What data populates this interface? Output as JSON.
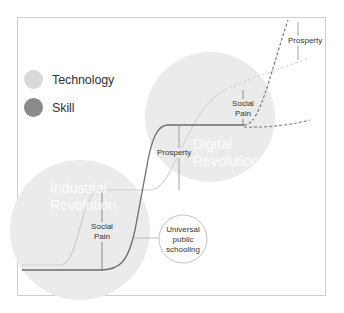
{
  "legend": {
    "items": [
      {
        "label": "Technology",
        "color": "#d9d9d9"
      },
      {
        "label": "Skill",
        "color": "#8a8a8a"
      }
    ]
  },
  "eras": {
    "industrial": {
      "line1": "Industrial",
      "line2": "Revolution"
    },
    "digital": {
      "line1": "Digital",
      "line2": "Revolution"
    }
  },
  "annotations": {
    "social_pain_1": {
      "line1": "Social",
      "line2": "Pain"
    },
    "prosperity_1": "Prosperty",
    "social_pain_2": {
      "line1": "Social",
      "line2": "Pain"
    },
    "prosperity_2": "Prosperty"
  },
  "callout": {
    "line1": "Universal",
    "line2": "public",
    "line3": "schooling"
  },
  "colors": {
    "era_circle": "#ebebeb",
    "technology_curve": "#cfcfcf",
    "skill_curve": "#6e6e6e",
    "frame_border": "#cfcfcf"
  }
}
